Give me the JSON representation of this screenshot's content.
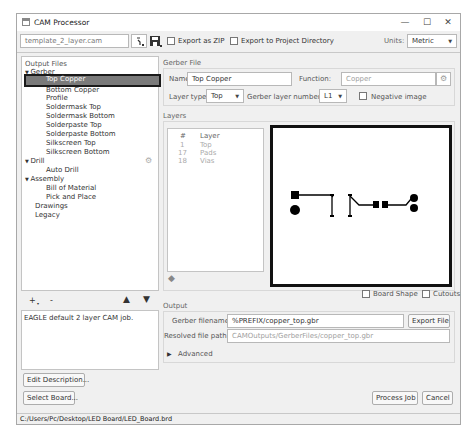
{
  "window": {
    "title": "CAM Processor",
    "controls": {
      "minimize": "—",
      "maximize": "☐",
      "close": "✕"
    }
  },
  "toolbar": {
    "cam_file": "template_2_layer.cam",
    "open_icon": "open-job-icon",
    "save_icon": "save-icon",
    "export_zip_label": "Export as ZIP",
    "export_project_label": "Export to Project Directory",
    "units_label": "Units:",
    "units_value": "Metric"
  },
  "output_files": {
    "header": "Output Files",
    "tree": [
      {
        "label": "Gerber",
        "level": 0,
        "expanded": true
      },
      {
        "label": "Top Copper",
        "level": 1,
        "selected": true
      },
      {
        "label": "Bottom Copper",
        "level": 1
      },
      {
        "label": "Profile",
        "level": 1
      },
      {
        "label": "Soldermask Top",
        "level": 1
      },
      {
        "label": "Soldermask Bottom",
        "level": 1
      },
      {
        "label": "Solderpaste Top",
        "level": 1
      },
      {
        "label": "Solderpaste Bottom",
        "level": 1
      },
      {
        "label": "Silkscreen Top",
        "level": 1
      },
      {
        "label": "Silkscreen Bottom",
        "level": 1
      },
      {
        "label": "Drill",
        "level": 0,
        "expanded": true
      },
      {
        "label": "Auto Drill",
        "level": 1
      },
      {
        "label": "Assembly",
        "level": 0,
        "expanded": true
      },
      {
        "label": "Bill of Material",
        "level": 1
      },
      {
        "label": "Pick and Place",
        "level": 1
      },
      {
        "label": "Drawings",
        "level": 0
      },
      {
        "label": "Legacy",
        "level": 0
      }
    ],
    "buttons": {
      "add": "+",
      "remove": "-",
      "up": "🡅",
      "down": "🡇"
    }
  },
  "description": {
    "text": "EAGLE default 2 layer CAM job.",
    "edit_button": "Edit Description...",
    "select_board_button": "Select Board..."
  },
  "gerber_file": {
    "section": "Gerber File",
    "name_label": "Name:",
    "name_value": "Top Copper",
    "function_label": "Function:",
    "function_value": "Copper",
    "layer_type_label": "Layer type:",
    "layer_type_value": "Top",
    "layer_number_label": "Gerber layer number:",
    "layer_number_value": "L1",
    "negative_label": "Negative image"
  },
  "layers": {
    "section": "Layers",
    "columns": [
      "#",
      "Layer"
    ],
    "rows": [
      {
        "num": "1",
        "name": "Top"
      },
      {
        "num": "17",
        "name": "Pads"
      },
      {
        "num": "18",
        "name": "Vias"
      }
    ]
  },
  "preview": {
    "board_shape_label": "Board Shape",
    "cutouts_label": "Cutouts"
  },
  "output": {
    "section": "Output",
    "filename_label": "Gerber filename:",
    "filename_value": "%PREFIX/copper_top.gbr",
    "export_button": "Export File",
    "resolved_label": "Resolved file path:",
    "resolved_value": "CAMOutputs/GerberFiles/copper_top.gbr",
    "advanced_label": "Advanced"
  },
  "footer": {
    "process_button": "Process Job",
    "cancel_button": "Cancel",
    "status_path": "C:/Users/Pc/Desktop/LED Board/LED_Board.brd"
  }
}
